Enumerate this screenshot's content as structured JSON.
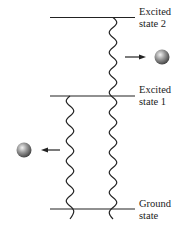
{
  "diagram": {
    "levels": [
      {
        "id": "excited-state-2",
        "line1": "Excited",
        "line2": "state 2",
        "y": 17
      },
      {
        "id": "excited-state-1",
        "line1": "Excited",
        "line2": "state 1",
        "y": 96
      },
      {
        "id": "ground-state",
        "line1": "Ground",
        "line2": "state",
        "y": 209
      }
    ],
    "transitions": [
      {
        "from": "excited-state-2",
        "to": "ground-state",
        "x": 113,
        "emission": "right"
      },
      {
        "from": "excited-state-1",
        "to": "ground-state",
        "x": 70,
        "emission": "left"
      }
    ],
    "colors": {
      "line": "#222222",
      "sphere": "#888888"
    }
  }
}
